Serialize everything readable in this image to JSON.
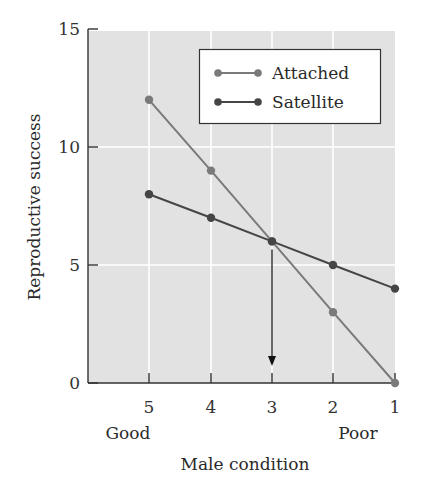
{
  "chart_data": {
    "type": "line",
    "title": "",
    "xlabel": "Male condition",
    "ylabel": "Reproductive success",
    "x": [
      5,
      4,
      3,
      2,
      1
    ],
    "x_tick_labels": [
      "5",
      "4",
      "3",
      "2",
      "1"
    ],
    "x_annotations": {
      "left": "Good",
      "right": "Poor"
    },
    "y_ticks": [
      0,
      5,
      10,
      15
    ],
    "y_tick_labels": [
      "0",
      "5",
      "10",
      "15"
    ],
    "ylim": [
      0,
      15
    ],
    "grid": true,
    "legend_position": "upper right",
    "series": [
      {
        "name": "Attached",
        "values": [
          12,
          9,
          6,
          3,
          0
        ],
        "color": "#7a7a7a"
      },
      {
        "name": "Satellite",
        "values": [
          8,
          7,
          6,
          5,
          4
        ],
        "color": "#454545"
      }
    ],
    "annotations": [
      {
        "type": "arrow",
        "x": 3,
        "from_y": 6,
        "to_y": 0,
        "description": "downward arrow from intersection point to x-axis at condition 3"
      }
    ]
  },
  "colors": {
    "plot_background": "#e2e2e2",
    "gridline": "#ffffff",
    "axis": "#333333"
  }
}
